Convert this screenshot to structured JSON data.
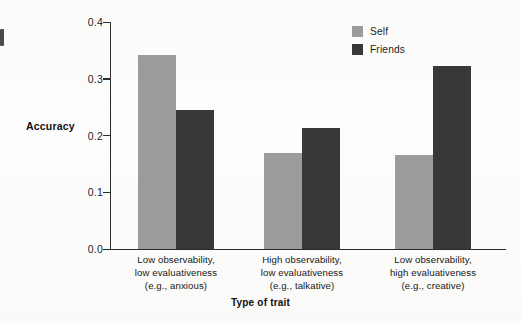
{
  "chart_data": {
    "type": "bar",
    "title": "",
    "xlabel": "Type of trait",
    "ylabel": "Accuracy",
    "ylim": [
      0.0,
      0.4
    ],
    "yticks": [
      "0.0",
      "0.1",
      "0.2",
      "0.3",
      "0.4"
    ],
    "ytick_values": [
      0.0,
      0.1,
      0.2,
      0.3,
      0.4
    ],
    "grid": false,
    "legend_position": "top-right",
    "categories": [
      "Low observability,\nlow evaluativeness\n(e.g., anxious)",
      "High observability,\nlow evaluativeness\n(e.g., talkative)",
      "Low observability,\nhigh evaluativeness\n(e.g., creative)"
    ],
    "category_lines": [
      [
        "Low observability,",
        "low evaluativeness",
        "(e.g., anxious)"
      ],
      [
        "High observability,",
        "low evaluativeness",
        "(e.g., talkative)"
      ],
      [
        "Low observability,",
        "high evaluativeness",
        "(e.g., creative)"
      ]
    ],
    "series": [
      {
        "name": "Self",
        "color": "#9c9c9c",
        "values": [
          0.342,
          0.17,
          0.165
        ]
      },
      {
        "name": "Friends",
        "color": "#383838",
        "values": [
          0.245,
          0.214,
          0.322
        ]
      }
    ]
  },
  "legend": {
    "items": [
      {
        "label": "Self",
        "color": "#9c9c9c"
      },
      {
        "label": "Friends",
        "color": "#383838"
      }
    ]
  },
  "axes": {
    "y_label": "Accuracy",
    "x_label": "Type of trait",
    "y_ticks": [
      "0.4",
      "0.3",
      "0.2",
      "0.1",
      "0.0"
    ]
  },
  "colors": {
    "self": "#9c9c9c",
    "friends": "#383838",
    "axis": "#2b2b2b",
    "background": "#fdfcfb",
    "text": "#1a1a1a"
  }
}
